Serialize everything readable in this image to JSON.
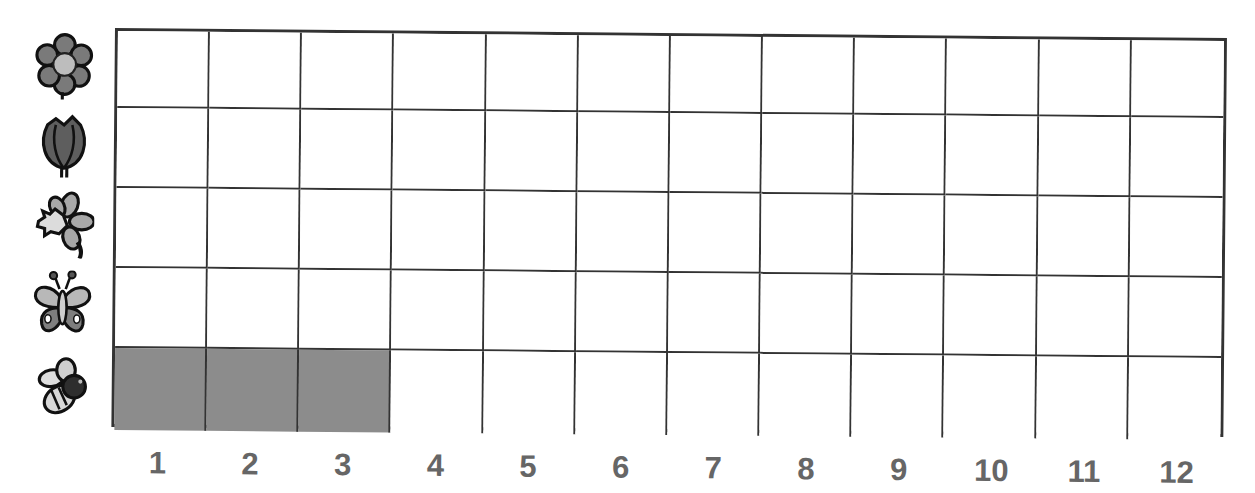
{
  "chart_data": {
    "type": "table",
    "title": "",
    "rows": [
      {
        "label": "flower",
        "icon": "flower-icon",
        "value": 0
      },
      {
        "label": "tulip",
        "icon": "tulip-icon",
        "value": 0
      },
      {
        "label": "daffodil",
        "icon": "daffodil-icon",
        "value": 0
      },
      {
        "label": "butterfly",
        "icon": "butterfly-icon",
        "value": 0
      },
      {
        "label": "bee",
        "icon": "bee-icon",
        "value": 3
      }
    ],
    "columns": [
      "1",
      "2",
      "3",
      "4",
      "5",
      "6",
      "7",
      "8",
      "9",
      "10",
      "11",
      "12"
    ],
    "xlim": [
      0,
      12
    ],
    "filled_cells": [
      {
        "row": "bee",
        "columns": [
          1,
          2,
          3
        ]
      }
    ],
    "colors": {
      "fill": "#8c8c8c",
      "grid": "#333333",
      "label": "#666666"
    }
  },
  "x_labels": [
    "1",
    "2",
    "3",
    "4",
    "5",
    "6",
    "7",
    "8",
    "9",
    "10",
    "11",
    "12"
  ]
}
